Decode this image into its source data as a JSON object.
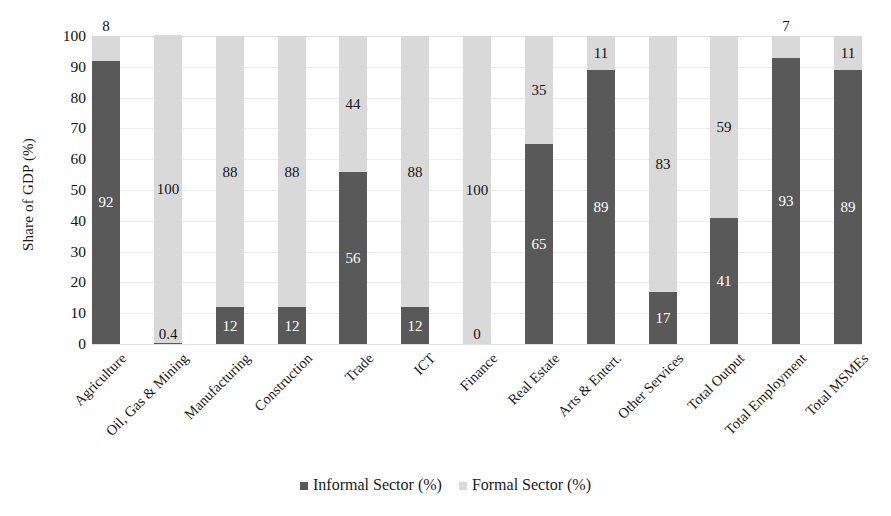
{
  "chart_data": {
    "type": "bar",
    "subtype": "stacked-100-percent",
    "title": "",
    "xlabel": "",
    "ylabel": "Share of GDP (%)",
    "ylim": [
      0,
      100
    ],
    "ytick_step": 10,
    "yticks": [
      "100",
      "90",
      "80",
      "70",
      "60",
      "50",
      "40",
      "30",
      "20",
      "10",
      "0"
    ],
    "grid": true,
    "legend_position": "bottom-center",
    "categories": [
      "Agriculture",
      "Oil, Gas & Mining",
      "Manufacturing",
      "Construction",
      "Trade",
      "ICT",
      "Finance",
      "Real Estate",
      "Arts & Entert.",
      "Other Services",
      "Total Output",
      "Total Employment",
      "Total MSMEs"
    ],
    "series": [
      {
        "name": "Informal Sector (%)",
        "color": "#595959",
        "values": [
          92,
          0.4,
          12,
          12,
          56,
          12,
          0,
          65,
          89,
          17,
          41,
          93,
          89
        ],
        "labels": [
          "92",
          "0.4",
          "12",
          "12",
          "56",
          "12",
          "0",
          "65",
          "89",
          "17",
          "41",
          "93",
          "89"
        ]
      },
      {
        "name": "Formal Sector (%)",
        "color": "#d9d9d9",
        "values": [
          8,
          100,
          88,
          88,
          44,
          88,
          100,
          35,
          11,
          83,
          59,
          7,
          11
        ],
        "labels": [
          "8",
          "100",
          "88",
          "88",
          "44",
          "88",
          "100",
          "35",
          "11",
          "83",
          "59",
          "7",
          "11"
        ]
      }
    ]
  },
  "legend": {
    "items": [
      {
        "label": "Informal Sector (%)",
        "swatch": "informal-swatch"
      },
      {
        "label": "Formal Sector (%)",
        "swatch": "formal-swatch"
      }
    ]
  },
  "colors": {
    "informal": "#595959",
    "formal": "#d9d9d9",
    "grid": "#eceaea",
    "text": "#141414",
    "background": "#ffffff"
  }
}
